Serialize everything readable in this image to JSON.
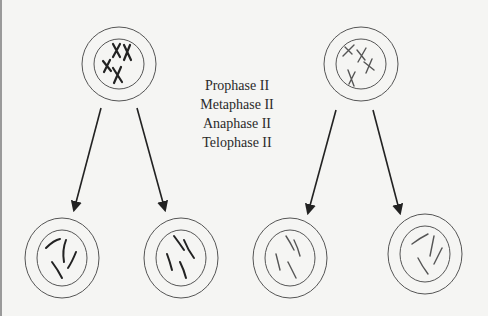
{
  "diagram": {
    "type": "meiosis-II",
    "phase_labels": [
      "Prophase II",
      "Metaphase II",
      "Anaphase II",
      "Telophase II"
    ],
    "parent_cells": [
      {
        "id": "left-parent",
        "chromosome_style": "dark"
      },
      {
        "id": "right-parent",
        "chromosome_style": "light"
      }
    ],
    "daughter_cells": [
      {
        "id": "left-daughter-1",
        "parent": "left-parent"
      },
      {
        "id": "left-daughter-2",
        "parent": "left-parent"
      },
      {
        "id": "right-daughter-1",
        "parent": "right-parent"
      },
      {
        "id": "right-daughter-2",
        "parent": "right-parent"
      }
    ],
    "colors": {
      "background": "#f5f5f3",
      "line": "#555555",
      "chromosome_dark": "#222222",
      "chromosome_light": "#555555",
      "text": "#2a2a2a"
    }
  }
}
